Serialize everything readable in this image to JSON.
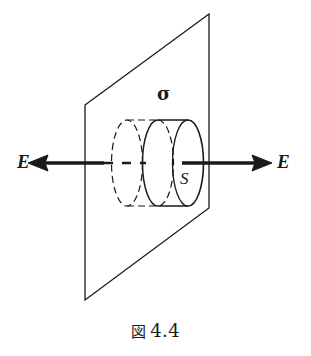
{
  "figure": {
    "caption_kanji": "図",
    "caption_number": "4.4",
    "caption_full": "図 4.4",
    "background_color": "#ffffff",
    "ink_color": "#1a1a1a"
  },
  "labels": {
    "field_left": "E",
    "field_right": "E",
    "surface_charge_density": "σ",
    "gaussian_area": "S"
  },
  "geometry": {
    "plane": {
      "name": "charged-plane",
      "corners": "85,105 209,14 209,208 85,300",
      "stroke_width": 1.3
    },
    "cylinder": {
      "name": "gaussian-cylinder",
      "left_cap_center_x": 127,
      "middle_cap_center_x": 158,
      "right_cap_center_x": 188,
      "center_y": 163,
      "cap_rx": 15,
      "cap_ry": 43
    },
    "axis": {
      "y": 163,
      "left_arrow_tip_x": 28,
      "right_arrow_tip_x": 272
    }
  }
}
